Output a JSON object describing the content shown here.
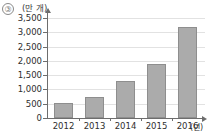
{
  "item_number": "③",
  "chart_data": {
    "type": "bar",
    "title": "",
    "xlabel": "(년)",
    "ylabel": "(만 개)",
    "categories": [
      "2012",
      "2013",
      "2014",
      "2015",
      "2016"
    ],
    "values": [
      520,
      750,
      1300,
      1900,
      3200
    ],
    "ylim": [
      0,
      3500
    ],
    "yticks": [
      0,
      500,
      1000,
      1500,
      2000,
      2500,
      3000,
      3500
    ],
    "ytick_labels": [
      "0",
      "500",
      "1,000",
      "1,500",
      "2,000",
      "2,500",
      "3,000",
      "3,500"
    ],
    "grid": true,
    "legend": null,
    "bar_color": "#ababab",
    "bar_border_color": "#8e8e8e",
    "axis_color": "#6d6d6d",
    "grid_color": "#e2e2e2"
  }
}
